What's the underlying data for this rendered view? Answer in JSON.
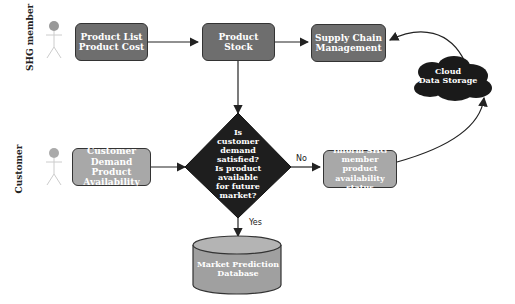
{
  "lanes": [
    {
      "label": "SHG member"
    },
    {
      "label": "Customer"
    }
  ],
  "nodes": {
    "product_list": {
      "line1": "Product List",
      "line2": "Product Cost"
    },
    "product_stock": {
      "label": "Product Stock"
    },
    "supply_chain": {
      "line1": "Supply Chain",
      "line2": "Management"
    },
    "cloud": {
      "line1": "Cloud",
      "line2": "Data Storage"
    },
    "customer_demand": {
      "line1": "Customer Demand",
      "line2": "Product Availability"
    },
    "decision": {
      "lines": [
        "Is",
        "customer",
        "demand",
        "satisfied?",
        "Is product available",
        "for future",
        "market?"
      ]
    },
    "inform_shg": {
      "line1": "Inform SHG",
      "line2": "member product",
      "line3": "availability status"
    },
    "database": {
      "line1": "Market Prediction",
      "line2": "Database"
    }
  },
  "edges": {
    "no_label": "No",
    "yes_label": "Yes"
  },
  "colors": {
    "dark_box": "#6e6e6e",
    "light_box": "#a8a8a8",
    "decision": "#1e1e1e",
    "cloud": "#1a1a1a",
    "line": "#222222"
  }
}
